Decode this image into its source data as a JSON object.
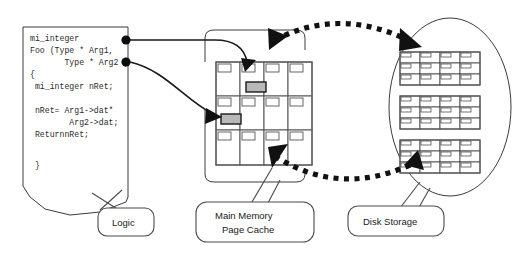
{
  "diagram": {
    "background_color": "#ffffff",
    "ink_color": "#1a1a1a"
  },
  "logic_block": {
    "label": "Logic",
    "code_lines": [
      "mi_integer",
      "Foo (Type * Arg1,",
      "       Type * Arg2 )",
      "{",
      " mi_integer nRet;",
      "",
      " nRet= Arg1->dat*",
      "        Arg2->dat;",
      " ReturnnRet;",
      "",
      " }"
    ],
    "connector_dots": 2
  },
  "memory_block": {
    "label_line1": "Main Memory",
    "label_line2": "Page Cache",
    "columns": 4,
    "rows": 3,
    "highlight_color": "#b8b8b8",
    "highlighted_pages": [
      {
        "row": 0,
        "col": 1
      },
      {
        "row": 1,
        "col": 0
      }
    ]
  },
  "disk_block": {
    "label": "Disk Storage",
    "block_count": 3,
    "block_columns": 4,
    "block_rows": 3
  },
  "connections": {
    "solid_arrow_count": 2,
    "dashed_arc_out_label": "page write-out to disk",
    "dashed_arc_in_label": "page read-in to cache"
  }
}
